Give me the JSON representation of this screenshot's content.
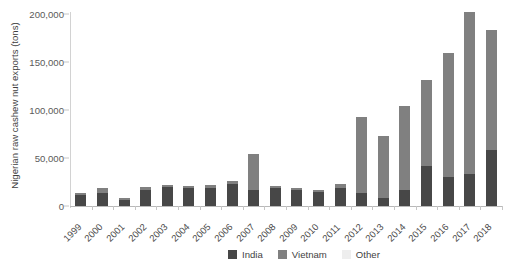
{
  "chart_data": {
    "type": "bar",
    "stacked": true,
    "title": "",
    "xlabel": "",
    "ylabel": "Nigerian raw cashew nut exports (tons)",
    "ylim": [
      0,
      200000
    ],
    "yticks": [
      0,
      50000,
      100000,
      150000,
      200000
    ],
    "ytick_labels": [
      "0",
      "50,000",
      "100,000",
      "150,000",
      "200,000"
    ],
    "grid": false,
    "legend_position": "bottom",
    "categories": [
      "1999",
      "2000",
      "2001",
      "2002",
      "2003",
      "2004",
      "2005",
      "2006",
      "2007",
      "2008",
      "2009",
      "2010",
      "2011",
      "2012",
      "2013",
      "2014",
      "2015",
      "2016",
      "2017",
      "2018"
    ],
    "series": [
      {
        "name": "India",
        "color": "#474747",
        "values": [
          11000,
          14000,
          6500,
          17000,
          20000,
          19000,
          19000,
          23000,
          17000,
          19000,
          17000,
          15000,
          19000,
          14000,
          8000,
          17000,
          42000,
          30000,
          33000,
          58000
        ]
      },
      {
        "name": "Vietnam",
        "color": "#808080",
        "values": [
          3000,
          5000,
          1500,
          3000,
          2000,
          2000,
          3000,
          3000,
          37000,
          1500,
          1500,
          1500,
          4000,
          79000,
          65000,
          87000,
          89000,
          129000,
          169000,
          125000
        ]
      },
      {
        "name": "Other",
        "color": "#eeeeee",
        "values": [
          0,
          0,
          0,
          0,
          0,
          0,
          0,
          0,
          0,
          0,
          0,
          0,
          0,
          0,
          0,
          0,
          0,
          0,
          0,
          0
        ]
      }
    ],
    "totals": [
      14000,
      19000,
      8000,
      20000,
      22000,
      21000,
      22000,
      26000,
      54000,
      20500,
      18500,
      16500,
      23000,
      93000,
      73000,
      104000,
      131000,
      159000,
      202000,
      183000
    ]
  },
  "legend": {
    "items": [
      {
        "label": "India",
        "color": "#474747"
      },
      {
        "label": "Vietnam",
        "color": "#808080"
      },
      {
        "label": "Other",
        "color": "#eeeeee"
      }
    ]
  }
}
